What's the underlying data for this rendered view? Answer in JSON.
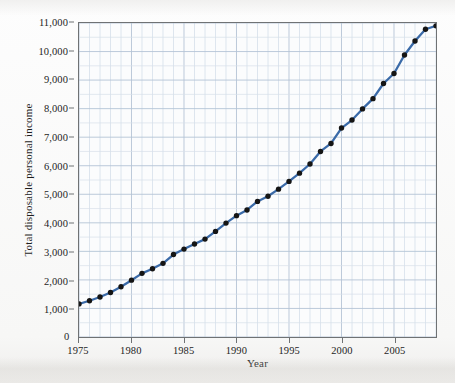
{
  "chart_data": {
    "type": "line",
    "title": "",
    "xlabel": "Year",
    "ylabel": "Total disposable personal income",
    "xlim": [
      1975,
      2009
    ],
    "ylim": [
      0,
      11000
    ],
    "y_major_ticks": [
      0,
      1000,
      2000,
      3000,
      4000,
      5000,
      6000,
      7000,
      8000,
      9000,
      10000,
      11000
    ],
    "y_tick_labels": [
      "0",
      "1,000",
      "2,000",
      "3,000",
      "4,000",
      "5,000",
      "6,000",
      "7,000",
      "8,000",
      "9,000",
      "10,000",
      "11,000"
    ],
    "x_major_ticks": [
      1975,
      1980,
      1985,
      1990,
      1995,
      2000,
      2005
    ],
    "x_tick_labels": [
      "1975",
      "1980",
      "1985",
      "1990",
      "1995",
      "2000",
      "2005"
    ],
    "grid": true,
    "grid_minor_y_step": 500,
    "grid_minor_x_step": 1,
    "legend": "none",
    "marker": "circle",
    "marker_color": "#151515",
    "line_color": "#3a6aa8",
    "x": [
      1975,
      1976,
      1977,
      1978,
      1979,
      1980,
      1981,
      1982,
      1983,
      1984,
      1985,
      1986,
      1987,
      1988,
      1989,
      1990,
      1991,
      1992,
      1993,
      1994,
      1995,
      1996,
      1997,
      1998,
      1999,
      2000,
      2001,
      2002,
      2003,
      2004,
      2005,
      2006,
      2007,
      2008,
      2009
    ],
    "values": [
      1160,
      1270,
      1400,
      1560,
      1760,
      1990,
      2230,
      2390,
      2580,
      2890,
      3080,
      3260,
      3430,
      3700,
      3990,
      4250,
      4450,
      4750,
      4930,
      5180,
      5450,
      5740,
      6060,
      6500,
      6780,
      7320,
      7600,
      7990,
      8350,
      8880,
      9230,
      9880,
      10370,
      10780,
      10900
    ],
    "series_name": "Total disposable personal income"
  },
  "axis": {
    "y_title": "Total disposable personal income",
    "x_title": "Year",
    "zero_label": "0"
  }
}
